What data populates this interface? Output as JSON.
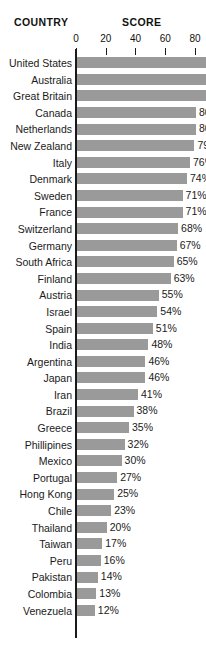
{
  "header": {
    "country_label": "COUNTRY",
    "score_label": "SCORE"
  },
  "axis": {
    "ticks": [
      "0",
      "20",
      "40",
      "60",
      "80"
    ]
  },
  "sidebar_text": {
    "lines": [
      "I",
      "w",
      "co",
      "of",
      "no",
      "bac",
      "dire",
      "the s",
      "cultu",
      "from"
    ]
  },
  "chart_data": {
    "type": "bar",
    "title": "SCORE",
    "xlabel": "SCORE",
    "ylabel": "COUNTRY",
    "orientation": "horizontal",
    "xlim": [
      0,
      90
    ],
    "grid": false,
    "legend": null,
    "tick_values": [
      0,
      20,
      40,
      60,
      80
    ],
    "bar_color": "#9a9a9a",
    "axis_color": "#1a1a1a",
    "categories": [
      "United States",
      "Australia",
      "Great Britain",
      "Canada",
      "Netherlands",
      "New Zealand",
      "Italy",
      "Denmark",
      "Sweden",
      "France",
      "Switzerland",
      "Germany",
      "South Africa",
      "Finland",
      "Austria",
      "Israel",
      "Spain",
      "India",
      "Argentina",
      "Japan",
      "Iran",
      "Brazil",
      "Greece",
      "Phillipines",
      "Mexico",
      "Portugal",
      "Hong Kong",
      "Chile",
      "Thailand",
      "Taiwan",
      "Peru",
      "Pakistan",
      "Colombia",
      "Venezuela"
    ],
    "values": [
      88,
      88,
      87,
      80,
      80,
      79,
      76,
      74,
      71,
      71,
      68,
      67,
      65,
      63,
      55,
      54,
      51,
      48,
      46,
      46,
      41,
      38,
      35,
      32,
      30,
      27,
      25,
      23,
      20,
      17,
      16,
      14,
      13,
      12
    ],
    "data_labels": [
      "",
      "",
      "",
      "80%",
      "80%",
      "79%",
      "76%",
      "74%",
      "71%",
      "71%",
      "68%",
      "67%",
      "65%",
      "63%",
      "55%",
      "54%",
      "51%",
      "48%",
      "46%",
      "46%",
      "41%",
      "38%",
      "35%",
      "32%",
      "30%",
      "27%",
      "25%",
      "23%",
      "20%",
      "17%",
      "16%",
      "14%",
      "13%",
      "12%"
    ]
  }
}
